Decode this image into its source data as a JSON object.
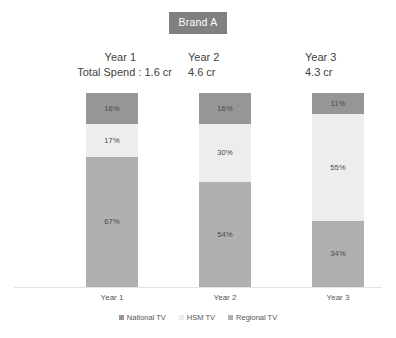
{
  "title": {
    "badge_label": "Brand A"
  },
  "headers": [
    {
      "year": "Year 1",
      "spend": "Total Spend : 1.6 cr"
    },
    {
      "year": "Year 2",
      "spend": "4.6 cr"
    },
    {
      "year": "Year 3",
      "spend": "4.3 cr"
    }
  ],
  "category_labels": [
    "Year 1",
    "Year 2",
    "Year 3"
  ],
  "legend": {
    "items": [
      {
        "label": "National TV",
        "color": "#969696",
        "icon": "square-swatch-icon"
      },
      {
        "label": "HSM TV",
        "color": "#ededed",
        "icon": "square-swatch-icon"
      },
      {
        "label": "Regional TV",
        "color": "#b0b0b0",
        "icon": "square-swatch-icon"
      }
    ]
  },
  "bars": {
    "year1": {
      "national": {
        "label": "16%",
        "value": 16
      },
      "hsm": {
        "label": "17%",
        "value": 17
      },
      "regional": {
        "label": "67%",
        "value": 67
      }
    },
    "year2": {
      "national": {
        "label": "16%",
        "value": 16
      },
      "hsm": {
        "label": "30%",
        "value": 30
      },
      "regional": {
        "label": "54%",
        "value": 54
      }
    },
    "year3": {
      "national": {
        "label": "11%",
        "value": 11
      },
      "hsm": {
        "label": "55%",
        "value": 55
      },
      "regional": {
        "label": "34%",
        "value": 34
      }
    }
  },
  "chart_data": {
    "type": "bar",
    "subtype": "stacked-100-percent",
    "title": "Brand A",
    "xlabel": "",
    "ylabel": "",
    "ylim": [
      0,
      100
    ],
    "grid": false,
    "legend_position": "bottom",
    "stack_order_top_to_bottom": [
      "National TV",
      "HSM TV",
      "Regional TV"
    ],
    "categories": [
      "Year 1",
      "Year 2",
      "Year 3"
    ],
    "series": [
      {
        "name": "National TV",
        "color": "#969696",
        "values": [
          16,
          16,
          11
        ]
      },
      {
        "name": "HSM TV",
        "color": "#ededed",
        "values": [
          17,
          30,
          55
        ]
      },
      {
        "name": "Regional TV",
        "color": "#b0b0b0",
        "values": [
          67,
          54,
          34
        ]
      }
    ],
    "data_labels": [
      [
        "16%",
        "17%",
        "67%"
      ],
      [
        "16%",
        "30%",
        "54%"
      ],
      [
        "11%",
        "55%",
        "34%"
      ]
    ],
    "annotations": [
      {
        "category": "Year 1",
        "text": "Total Spend : 1.6 cr"
      },
      {
        "category": "Year 2",
        "text": "4.6 cr"
      },
      {
        "category": "Year 3",
        "text": "4.3 cr"
      }
    ]
  }
}
